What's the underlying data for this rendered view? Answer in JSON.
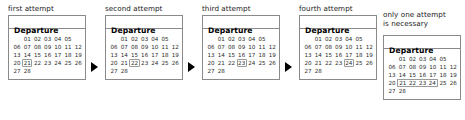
{
  "diagram": {
    "panel_title": "Departure",
    "weekday_grid_columns": 7,
    "steps": [
      {
        "caption": "first attempt",
        "weeks": [
          [
            "",
            "01",
            "02",
            "03",
            "04",
            "05"
          ],
          [
            "06",
            "07",
            "08",
            "09",
            "10",
            "11",
            "12"
          ],
          [
            "13",
            "14",
            "15",
            "16",
            "17",
            "18",
            "19"
          ],
          [
            "20",
            "21",
            "22",
            "23",
            "24",
            "25",
            "26"
          ],
          [
            "27",
            "28"
          ]
        ],
        "selection": {
          "type": "single",
          "values": [
            "21"
          ]
        }
      },
      {
        "caption": "second attempt",
        "weeks": [
          [
            "",
            "01",
            "02",
            "03",
            "04",
            "05"
          ],
          [
            "06",
            "07",
            "08",
            "09",
            "10",
            "11",
            "12"
          ],
          [
            "13",
            "14",
            "15",
            "16",
            "17",
            "18",
            "19"
          ],
          [
            "20",
            "21",
            "22",
            "23",
            "24",
            "25",
            "26"
          ],
          [
            "27",
            "28"
          ]
        ],
        "selection": {
          "type": "single",
          "values": [
            "22"
          ]
        }
      },
      {
        "caption": "third attempt",
        "weeks": [
          [
            "",
            "01",
            "02",
            "03",
            "04",
            "05"
          ],
          [
            "06",
            "07",
            "08",
            "09",
            "10",
            "11",
            "12"
          ],
          [
            "13",
            "14",
            "15",
            "16",
            "17",
            "18",
            "19"
          ],
          [
            "20",
            "21",
            "22",
            "23",
            "24",
            "25",
            "26"
          ],
          [
            "27",
            "28"
          ]
        ],
        "selection": {
          "type": "single",
          "values": [
            "23"
          ]
        }
      },
      {
        "caption": "fourth attempt",
        "weeks": [
          [
            "",
            "01",
            "02",
            "03",
            "04",
            "05"
          ],
          [
            "06",
            "07",
            "08",
            "09",
            "10",
            "11",
            "12"
          ],
          [
            "13",
            "14",
            "15",
            "16",
            "17",
            "18",
            "19"
          ],
          [
            "20",
            "21",
            "22",
            "23",
            "24",
            "25",
            "26"
          ],
          [
            "27",
            "28"
          ]
        ],
        "selection": {
          "type": "single",
          "values": [
            "24"
          ]
        }
      },
      {
        "caption": "only one attempt\nis necessary",
        "weeks": [
          [
            "",
            "01",
            "02",
            "03",
            "04",
            "05"
          ],
          [
            "06",
            "07",
            "08",
            "09",
            "10",
            "11",
            "12"
          ],
          [
            "13",
            "14",
            "15",
            "16",
            "17",
            "18",
            "19"
          ],
          [
            "20",
            "21",
            "22",
            "23",
            "24",
            "25",
            "26"
          ],
          [
            "27",
            "28"
          ]
        ],
        "selection": {
          "type": "range",
          "values": [
            "21",
            "22",
            "23",
            "24"
          ]
        }
      }
    ],
    "arrows": [
      {
        "glyph": "play-triangle-right"
      },
      {
        "glyph": "play-triangle-right"
      },
      {
        "glyph": "play-triangle-right"
      }
    ],
    "colors": {
      "background": "#ffffff",
      "panel_border": "#8a8a8a",
      "selection_border": "#9a9a9a",
      "text": "#1a1a1a",
      "arrow": "#000000"
    }
  }
}
